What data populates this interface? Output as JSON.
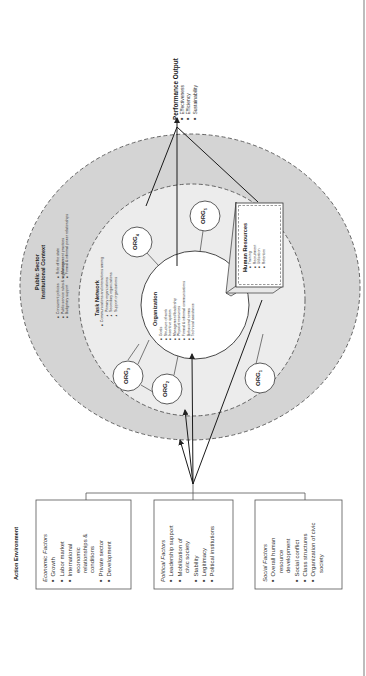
{
  "performance_output": {
    "title": "Performance Output",
    "items": [
      "Effectiveness",
      "Efficiency",
      "Sustainability"
    ]
  },
  "public_sector": {
    "title_line1": "Public Sector",
    "title_line2": "Institutional Context",
    "items_col1": [
      "Concurrent policies",
      "Public service rules & regulations",
      "Budgetary support"
    ],
    "items_col2": [
      "Role of the state",
      "Management practices",
      "Formal & informal power relationships"
    ]
  },
  "task_network": {
    "title": "Task Network",
    "lead_item": "Communications and interactions among",
    "sub_items": [
      "Primary organizations",
      "Secondary organizations",
      "Support organizations"
    ]
  },
  "organization": {
    "title": "Organization",
    "items": [
      "Goals",
      "Structure of work",
      "Incentive system",
      "Management/leadership",
      "Physical resources",
      "Formal & informal communications",
      "Behavioral norms",
      "Technical assistance"
    ]
  },
  "human_resources": {
    "title": "Human Resources",
    "items": [
      "Training",
      "Recruitment",
      "Utilization",
      "Retention"
    ]
  },
  "orgs": [
    {
      "name": "ORG",
      "sub": "1"
    },
    {
      "name": "ORG",
      "sub": "2"
    },
    {
      "name": "ORG",
      "sub": "3"
    },
    {
      "name": "ORG",
      "sub": "4"
    },
    {
      "name": "ORG",
      "sub": "5"
    }
  ],
  "action_environment": {
    "title": "Action Environment",
    "economic": {
      "heading": "Economic Factors",
      "items": [
        "Growth",
        "Labor market",
        "International",
        "Private sector",
        "Development"
      ],
      "continuation": [
        "economic",
        "relationships &",
        "conditions"
      ]
    },
    "political": {
      "heading": "Political Factors",
      "items": [
        "Leadership support",
        "Mobilization of",
        "Stability",
        "Legitimacy",
        "Political institutions"
      ],
      "continuation": [
        "civic society"
      ]
    },
    "social": {
      "heading": "Social Factors",
      "items": [
        "Overall human",
        "Social conflict",
        "Class structures",
        "Organization of civic"
      ],
      "continuation_overall": [
        "resource",
        "development"
      ],
      "continuation_org": [
        "society"
      ]
    }
  },
  "colors": {
    "outer_ring": "#d4d4d4",
    "inner_ring": "#ececec",
    "core": "#ffffff",
    "stroke": "#333333",
    "dash": "#555555"
  }
}
